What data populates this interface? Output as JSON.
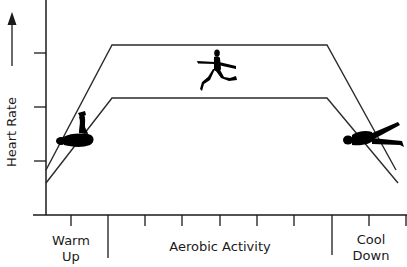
{
  "diagram": {
    "type": "exercise-heart-rate-profile",
    "y_axis": {
      "label": "Heart Rate",
      "arrow": "up-arrow"
    },
    "phases": [
      {
        "label_line1": "Warm",
        "label_line2": "Up"
      },
      {
        "label_line1": "Aerobic Activity",
        "label_line2": ""
      },
      {
        "label_line1": "Cool",
        "label_line2": "Down"
      }
    ],
    "zones": [
      {
        "name": "upper-bound",
        "points": [
          [
            46,
            170
          ],
          [
            112,
            45
          ],
          [
            327,
            45
          ],
          [
            396,
            170
          ]
        ]
      },
      {
        "name": "lower-bound",
        "points": [
          [
            46,
            183
          ],
          [
            112,
            98
          ],
          [
            327,
            98
          ],
          [
            398,
            183
          ]
        ]
      }
    ],
    "figures": [
      "stretching-figure",
      "running-figure",
      "reclining-figure"
    ],
    "colors": {
      "line": "#2a2a2a",
      "figure": "#000000",
      "text": "#1a1a1a",
      "background": "#ffffff"
    }
  }
}
